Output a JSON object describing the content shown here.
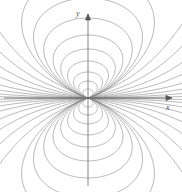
{
  "figure": {
    "type": "field-line-diagram",
    "width": 182,
    "height": 192,
    "background_color": "#ffffff"
  },
  "axes": {
    "x": {
      "label": "x",
      "orientation": "horizontal",
      "arrow": "right",
      "start_px": 4,
      "end_px": 172,
      "y_px": 98,
      "color": "#555555"
    },
    "y": {
      "label": "y",
      "orientation": "vertical",
      "arrow": "up",
      "start_px": 186,
      "end_px": 14,
      "x_px": 88,
      "color": "#555555"
    },
    "origin": {
      "x_px": 88,
      "y_px": 98
    }
  },
  "chart_data": {
    "type": "line",
    "xlabel": "x",
    "ylabel": "y",
    "grid": false,
    "legend": null,
    "origin": {
      "x": 88,
      "y": 98
    },
    "line_color": "#8a8a8a",
    "line_width": 0.6,
    "loops_per_lobe": 9,
    "lobe_half_widths_px": [
      6,
      11,
      17,
      24,
      32,
      41,
      52,
      64,
      78
    ],
    "lobe_heights_px": [
      9,
      17,
      26,
      37,
      49,
      63,
      80,
      100,
      124
    ],
    "fan_count_per_side": 8,
    "fan_exit_slopes": [
      0.02,
      0.06,
      0.12,
      0.2,
      0.32,
      0.48,
      0.7,
      1.0
    ]
  },
  "colors": {
    "background": "#ffffff",
    "field_line": "#8a8a8a",
    "axis": "#555555",
    "label": "#4a4a4a"
  }
}
